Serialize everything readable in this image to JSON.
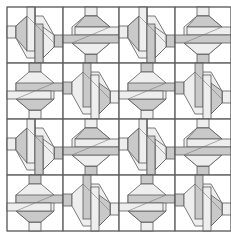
{
  "diagram": {
    "type": "quilt-block-pattern",
    "grid": {
      "rows": 4,
      "cols": 4,
      "cell_px": 56,
      "origin": [
        7,
        7
      ],
      "size_px": 224
    },
    "repeat_unit": "2x2 blocks, tiled 2x2",
    "colors": {
      "background": "#ffffff",
      "dark_fabric": "#c9c9c9",
      "light_fabric": "#eeeeee",
      "outline": "#5a5a5a"
    },
    "block_types": [
      {
        "id": "A",
        "position": "top-left of unit",
        "description": "vertical bar with diagonal hexagon pointing left/right"
      },
      {
        "id": "B",
        "position": "top-right of unit",
        "description": "horizontal bar with hexagon pointing up/down"
      },
      {
        "id": "C",
        "position": "bottom-left of unit",
        "description": "horizontal bar with hexagon pointing up/down (mirrored)"
      },
      {
        "id": "D",
        "position": "bottom-right of unit",
        "description": "vertical bar with diagonal hexagon pointing left/right (mirrored)"
      }
    ]
  }
}
